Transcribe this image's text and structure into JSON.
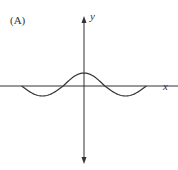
{
  "panel_label": "(A)",
  "chart_data": {
    "type": "line",
    "title": "",
    "xlabel": "x",
    "ylabel": "y",
    "xlim": [
      -6.3,
      6.3
    ],
    "ylim": [
      -4,
      4
    ],
    "grid": false,
    "ticks": false,
    "legend": "none",
    "series": [
      {
        "name": "curve",
        "description": "cosine-like wave: peak at origin, troughs on either side, ends on x-axis",
        "x": [
          -3.0,
          -2.0,
          -1.0,
          0.0,
          1.0,
          2.0,
          3.0
        ],
        "y": [
          0.0,
          -0.5,
          0.0,
          0.65,
          0.0,
          -0.5,
          0.0
        ]
      }
    ],
    "colors": {
      "axes": "#333333",
      "curve": "#333333"
    }
  }
}
